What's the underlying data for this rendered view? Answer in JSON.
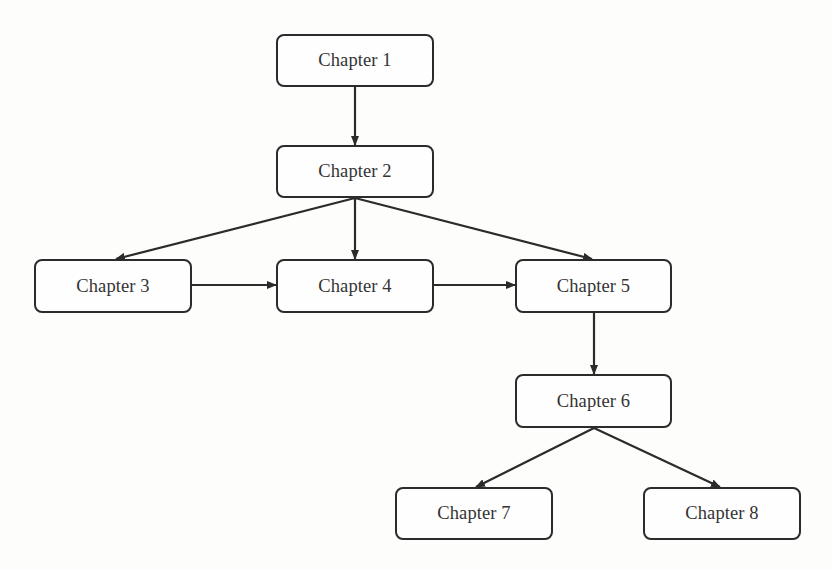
{
  "diagram": {
    "type": "flowchart",
    "colors": {
      "stroke": "#2b2b2b",
      "text": "#333333",
      "background": "#fdfdfc"
    },
    "nodes": [
      {
        "id": "ch1",
        "label": "Chapter 1",
        "x": 276,
        "y": 34,
        "w": 158,
        "h": 53
      },
      {
        "id": "ch2",
        "label": "Chapter 2",
        "x": 276,
        "y": 145,
        "w": 158,
        "h": 53
      },
      {
        "id": "ch3",
        "label": "Chapter 3",
        "x": 34,
        "y": 259,
        "w": 158,
        "h": 54
      },
      {
        "id": "ch4",
        "label": "Chapter 4",
        "x": 276,
        "y": 259,
        "w": 158,
        "h": 54
      },
      {
        "id": "ch5",
        "label": "Chapter 5",
        "x": 515,
        "y": 259,
        "w": 157,
        "h": 54
      },
      {
        "id": "ch6",
        "label": "Chapter 6",
        "x": 515,
        "y": 374,
        "w": 157,
        "h": 54
      },
      {
        "id": "ch7",
        "label": "Chapter 7",
        "x": 395,
        "y": 487,
        "w": 158,
        "h": 53
      },
      {
        "id": "ch8",
        "label": "Chapter 8",
        "x": 643,
        "y": 487,
        "w": 158,
        "h": 53
      }
    ],
    "edges": [
      {
        "from": "ch1",
        "to": "ch2"
      },
      {
        "from": "ch2",
        "to": "ch3"
      },
      {
        "from": "ch2",
        "to": "ch4"
      },
      {
        "from": "ch2",
        "to": "ch5"
      },
      {
        "from": "ch3",
        "to": "ch4"
      },
      {
        "from": "ch4",
        "to": "ch5"
      },
      {
        "from": "ch5",
        "to": "ch6"
      },
      {
        "from": "ch6",
        "to": "ch7"
      },
      {
        "from": "ch6",
        "to": "ch8"
      }
    ]
  }
}
